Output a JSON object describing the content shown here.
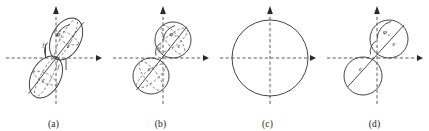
{
  "figure": {
    "background_color": "#ffffff",
    "stroke_color": "#3a3a3a",
    "axis_color": "#4a4a4a",
    "panel_count": 4
  },
  "panels": [
    {
      "id": "a",
      "caption": "(a)",
      "shape_description": "two elongated tilted ellipsoids joined at origin",
      "labels": {
        "phi": "φ",
        "phi_subscript": "c",
        "upper_e": "e",
        "lower_e": "e",
        "f_upper": "f",
        "f_lower": "f"
      }
    },
    {
      "id": "b",
      "caption": "(b)",
      "shape_description": "two tangent spheres on a tilted axis",
      "labels": {
        "phi": "φ",
        "phi_subscript": "c",
        "upper_e": "e",
        "lower_e": "e",
        "f_upper": "f"
      }
    },
    {
      "id": "c",
      "caption": "(c)",
      "shape_description": "single circle centered at the origin",
      "labels": {}
    },
    {
      "id": "d",
      "caption": "(d)",
      "shape_description": "two tangent circles with a tilted diameter",
      "labels": {
        "phi": "φ",
        "phi_subscript": "c",
        "upper_e": "e",
        "lower_e": "e"
      }
    }
  ],
  "axes": {
    "style": "dashed",
    "x_arrow_direction": "right",
    "y_arrow_direction": "up"
  }
}
